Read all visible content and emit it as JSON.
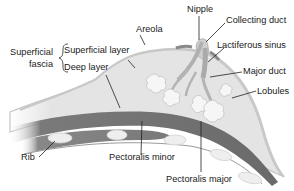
{
  "diagram": {
    "colors": {
      "background": "#ffffff",
      "breast_fill": "#e4e4e4",
      "skin_outline": "#bdbdbd",
      "muscle_dark": "#6e6e6e",
      "muscle_mid": "#8a8a8a",
      "lobule_fill": "#f4f4f4",
      "rib_fill": "#ececec",
      "leader_line": "#222222",
      "text": "#1a1a1a"
    },
    "labels": {
      "nipple": "Nipple",
      "areola": "Areola",
      "collecting_duct": "Collecting duct",
      "lactiferous_sinus": "Lactiferous sinus",
      "major_duct": "Major duct",
      "lobules": "Lobules",
      "superficial_fascia_line1": "Superficial",
      "superficial_fascia_line2": "fascia",
      "superficial_layer": "Superficial layer",
      "deep_layer": "Deep layer",
      "rib": "Rib",
      "pectoralis_minor": "Pectoralis minor",
      "pectoralis_major": "Pectoralis major"
    }
  }
}
